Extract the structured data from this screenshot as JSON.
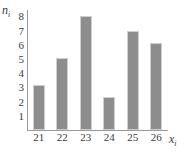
{
  "chart_data": {
    "type": "bar",
    "title": "",
    "subtitle": "",
    "xlabel": "x",
    "xlabel_sub": "i",
    "ylabel": "n",
    "ylabel_sub": "i",
    "categories": [
      "21",
      "22",
      "23",
      "24",
      "25",
      "26"
    ],
    "values": [
      3.2,
      5.1,
      8.0,
      2.3,
      7.0,
      6.1
    ],
    "yticks": [
      "8",
      "7",
      "6",
      "5",
      "4",
      "3",
      "2",
      "1"
    ],
    "ytick_values": [
      8,
      7,
      6,
      5,
      4,
      3,
      2,
      1
    ],
    "ylim": [
      0,
      8.45
    ],
    "grid": false,
    "legend": null,
    "bar_color": "#8d8d8d",
    "bar_border_color": "#cfcfcf",
    "axis_color": "#9a9a9a",
    "text_color": "#3a3a3a"
  }
}
